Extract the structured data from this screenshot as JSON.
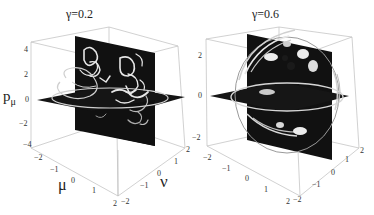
{
  "figure": {
    "panels": [
      {
        "title": "γ=0.2",
        "gamma": 0.2,
        "axes": {
          "vertical": {
            "label": "p",
            "label_sub": "μ",
            "ticks": [
              "4",
              "2",
              "0",
              "−2",
              "−4"
            ],
            "range": [
              -4,
              4
            ]
          },
          "mu": {
            "label": "μ",
            "ticks": [
              "−2",
              "−1",
              "0",
              "1",
              "2"
            ],
            "range": [
              -2,
              2
            ]
          },
          "nu": {
            "label": "ν",
            "ticks": [
              "−2",
              "−1",
              "0",
              "1",
              "2"
            ],
            "range": [
              -2,
              2
            ]
          }
        },
        "description": "Two orthogonal dark slice planes (vertical and horizontal) showing bright mottled density patterns with a ring-shaped orbit trajectory"
      },
      {
        "title": "γ=0.6",
        "gamma": 0.6,
        "axes": {
          "vertical": {
            "label": "",
            "ticks": [
              "2",
              "0",
              "−2"
            ],
            "range": [
              -2,
              2
            ]
          },
          "mu": {
            "label": "",
            "ticks": [
              "−2",
              "−1",
              "0",
              "1",
              "2"
            ],
            "range": [
              -2,
              2
            ]
          },
          "nu": {
            "label": "",
            "ticks": [
              "−2",
              "−1",
              "0",
              "1",
              "2"
            ],
            "range": [
              -2,
              2
            ]
          }
        },
        "description": "Two orthogonal dark slice planes with a spherical shell of bright swirling trajectories"
      }
    ],
    "colors": {
      "plane": "#111111",
      "highlight": "#e8e8e8",
      "box_edge": "#b8b8b8",
      "text": "#222222"
    }
  }
}
